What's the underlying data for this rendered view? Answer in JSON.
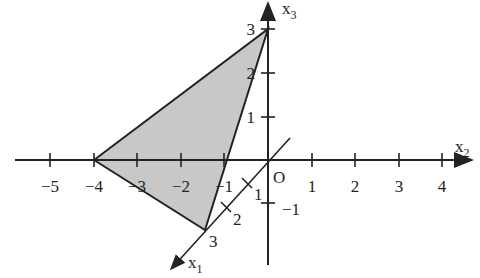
{
  "diagram": {
    "title": "",
    "axes": {
      "x1": {
        "label": "x",
        "subscript": "1",
        "ticks": [
          {
            "value": 1,
            "label": "1"
          },
          {
            "value": 2,
            "label": "2"
          },
          {
            "value": 3,
            "label": "3"
          }
        ]
      },
      "x2": {
        "label": "x",
        "subscript": "2",
        "ticks": [
          {
            "value": -5,
            "label": "−5"
          },
          {
            "value": -4,
            "label": "−4"
          },
          {
            "value": -3,
            "label": "−3"
          },
          {
            "value": -2,
            "label": "−2"
          },
          {
            "value": -1,
            "label": "−1"
          },
          {
            "value": 1,
            "label": "1"
          },
          {
            "value": 2,
            "label": "2"
          },
          {
            "value": 3,
            "label": "3"
          },
          {
            "value": 4,
            "label": "4"
          }
        ]
      },
      "x3": {
        "label": "x",
        "subscript": "3",
        "ticks": [
          {
            "value": -1,
            "label": "−1"
          },
          {
            "value": 1,
            "label": "1"
          },
          {
            "value": 2,
            "label": "2"
          },
          {
            "value": 3,
            "label": "3"
          }
        ]
      }
    },
    "origin_label": "O",
    "triangle": {
      "vertices": [
        [
          3,
          0,
          0
        ],
        [
          0,
          -4,
          0
        ],
        [
          0,
          0,
          3
        ]
      ],
      "fill": "#c8c8c8",
      "stroke": "#222222"
    }
  }
}
